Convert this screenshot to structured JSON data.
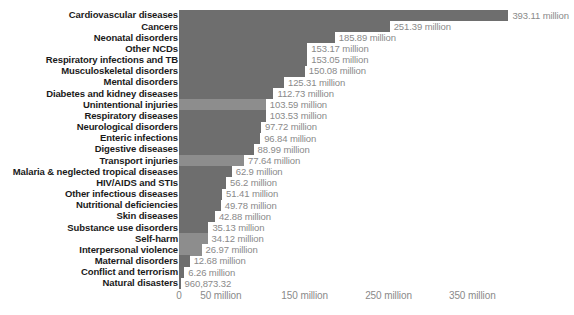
{
  "chart": {
    "title": "",
    "type": "bar",
    "orientation": "horizontal",
    "bar_color": "#6e6e6e",
    "bar_color_light": "#8d8d8d",
    "label_color": "#1a1a1a",
    "value_label_color": "#8a8a8a",
    "axis_label_color": "#8a8a8a",
    "background": "#ffffff"
  },
  "chart_data": {
    "type": "bar",
    "title": "",
    "xlabel": "",
    "ylabel": "",
    "xlim": [
      0,
      400
    ],
    "grid": false,
    "legend": null,
    "unit": "million",
    "categories": [
      "Cardiovascular diseases",
      "Cancers",
      "Neonatal disorders",
      "Other NCDs",
      "Respiratory infections and TB",
      "Musculoskeletal disorders",
      "Mental disorders",
      "Diabetes and kidney diseases",
      "Unintentional injuries",
      "Respiratory diseases",
      "Neurological disorders",
      "Enteric infections",
      "Digestive diseases",
      "Transport injuries",
      "Malaria & neglected tropical diseases",
      "HIV/AIDS and STIs",
      "Other infectious diseases",
      "Nutritional deficiencies",
      "Skin diseases",
      "Substance use disorders",
      "Self-harm",
      "Interpersonal violence",
      "Maternal disorders",
      "Conflict and terrorism",
      "Natural disasters"
    ],
    "values": [
      393.11,
      251.39,
      185.89,
      153.17,
      153.05,
      150.08,
      125.31,
      112.73,
      103.59,
      103.53,
      97.72,
      96.84,
      88.99,
      77.64,
      62.9,
      56.2,
      51.41,
      49.78,
      42.88,
      35.13,
      34.12,
      26.97,
      12.68,
      6.26,
      0.96087332
    ],
    "value_labels": [
      "393.11 million",
      "251.39 million",
      "185.89 million",
      "153.17 million",
      "153.05 million",
      "150.08 million",
      "125.31 million",
      "112.73 million",
      "103.59 million",
      "103.53 million",
      "97.72 million",
      "96.84 million",
      "88.99 million",
      "77.64 million",
      "62.9 million",
      "56.2 million",
      "51.41 million",
      "49.78 million",
      "42.88 million",
      "35.13 million",
      "34.12 million",
      "26.97 million",
      "12.68 million",
      "6.26 million",
      "960,873.32"
    ],
    "xticks": [
      0,
      50,
      150,
      250,
      350
    ],
    "xtick_labels": [
      "0",
      "50 million",
      "150 million",
      "250 million",
      "350 million"
    ]
  }
}
